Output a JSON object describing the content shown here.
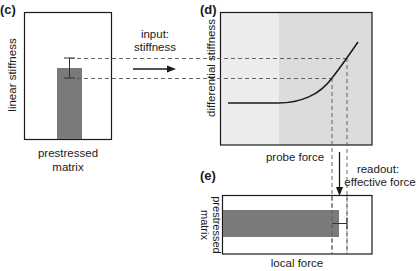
{
  "panels": {
    "c": {
      "label": "(c)",
      "ylabel": "linear stiffness",
      "xlabel_line1": "prestressed",
      "xlabel_line2": "matrix"
    },
    "d": {
      "label": "(d)",
      "ylabel": "differential stiffness",
      "xlabel": "probe force"
    },
    "e": {
      "label": "(e)",
      "ylabel_line1": "prestressed",
      "ylabel_line2": "matrix",
      "xlabel": "local force"
    }
  },
  "annotations": {
    "input_line1": "input:",
    "input_line2": "stiffness",
    "readout_line1": "readout:",
    "readout_line2": "effective force"
  },
  "colors": {
    "bar": "#7a7a7a",
    "panel_d_left_bg": "#ececec",
    "panel_d_right_bg": "#dcdcdc",
    "line": "#1a1a1a",
    "dash": "#555555"
  }
}
